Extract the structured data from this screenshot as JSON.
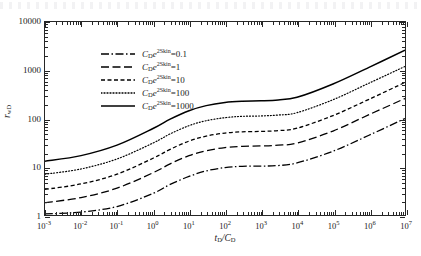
{
  "chart_data": {
    "type": "line",
    "title": "",
    "xlabel": "tD/CD",
    "ylabel": "rwD",
    "xscale": "log",
    "yscale": "log",
    "xlim": [
      0.001,
      10000000
    ],
    "ylim": [
      1,
      10000
    ],
    "grid": false,
    "legend_position": "upper-left",
    "xticklabels": [
      "10-3",
      "10-2",
      "10-1",
      "100",
      "101",
      "102",
      "103",
      "104",
      "105",
      "106",
      "107"
    ],
    "xtick_exponents": [
      "-3",
      "-2",
      "-1",
      "0",
      "1",
      "2",
      "3",
      "4",
      "5",
      "6",
      "7"
    ],
    "yticklabels": [
      "1",
      "10",
      "100",
      "1000",
      "10000"
    ],
    "ytickvalues": [
      1,
      10,
      100,
      1000,
      10000
    ],
    "series": [
      {
        "name": "CD e^2Skin = 0.1",
        "legend_prefix": "C",
        "legend_sub": "D",
        "legend_e": "e",
        "legend_sup": "2Skin",
        "value_label": "0.1",
        "linestyle": "dash-dot",
        "color": "#000000",
        "x": [
          0.001,
          0.01,
          0.1,
          1,
          3,
          10,
          30,
          100,
          300,
          1000,
          3000,
          10000,
          100000,
          1000000,
          10000000
        ],
        "y": [
          1.05,
          1.15,
          1.5,
          2.8,
          4.3,
          6.3,
          8.2,
          9.6,
          10.2,
          10.3,
          10.6,
          12.0,
          21.0,
          45.0,
          100.0
        ]
      },
      {
        "name": "CD e^2Skin = 1",
        "legend_prefix": "C",
        "legend_sub": "D",
        "legend_e": "e",
        "legend_sup": "2Skin",
        "value_label": "1",
        "linestyle": "long-dash",
        "color": "#000000",
        "x": [
          0.001,
          0.01,
          0.1,
          1,
          3,
          10,
          30,
          100,
          300,
          1000,
          3000,
          10000,
          100000,
          1000000,
          10000000
        ],
        "y": [
          1.8,
          2.3,
          3.6,
          7.5,
          11.5,
          17.0,
          21.5,
          25.0,
          26.5,
          27.0,
          28.0,
          31.0,
          55.0,
          120.0,
          260.0
        ]
      },
      {
        "name": "CD e^2Skin = 10",
        "legend_prefix": "C",
        "legend_sub": "D",
        "legend_e": "e",
        "legend_sup": "2Skin",
        "value_label": "10",
        "linestyle": "short-dash",
        "color": "#000000",
        "x": [
          0.001,
          0.01,
          0.1,
          1,
          3,
          10,
          30,
          100,
          300,
          1000,
          3000,
          10000,
          100000,
          1000000,
          10000000
        ],
        "y": [
          3.4,
          4.4,
          7.0,
          15.0,
          23.0,
          34.0,
          43.0,
          50.0,
          53.0,
          54.0,
          56.0,
          63.0,
          115.0,
          250.0,
          560.0
        ]
      },
      {
        "name": "CD e^2Skin = 100",
        "legend_prefix": "C",
        "legend_sub": "D",
        "legend_e": "e",
        "legend_sup": "2Skin",
        "value_label": "100",
        "linestyle": "dotted",
        "color": "#000000",
        "x": [
          0.001,
          0.01,
          0.1,
          1,
          3,
          10,
          30,
          100,
          300,
          1000,
          3000,
          10000,
          100000,
          1000000,
          10000000
        ],
        "y": [
          7.0,
          9.0,
          14.5,
          31.0,
          48.0,
          71.0,
          90.0,
          104.0,
          111.0,
          113.0,
          118.0,
          132.0,
          245.0,
          540.0,
          1200.0
        ]
      },
      {
        "name": "CD e^2Skin = 1000",
        "legend_prefix": "C",
        "legend_sub": "D",
        "legend_e": "e",
        "legend_sup": "2Skin",
        "value_label": "1000",
        "linestyle": "solid",
        "color": "#000000",
        "x": [
          0.001,
          0.01,
          0.1,
          1,
          3,
          10,
          30,
          100,
          300,
          1000,
          3000,
          10000,
          100000,
          1000000,
          10000000
        ],
        "y": [
          13.0,
          17.0,
          28.0,
          62.0,
          97.0,
          145.0,
          185.0,
          215.0,
          228.0,
          233.0,
          243.0,
          275.0,
          520.0,
          1150.0,
          2600.0
        ]
      }
    ]
  },
  "axes": {
    "x_title_num": "t",
    "x_title_num_sub": "D",
    "x_title_sep": "/",
    "x_title_den": "C",
    "x_title_den_sub": "D",
    "y_title_main": "r",
    "y_title_sub": "wD"
  }
}
